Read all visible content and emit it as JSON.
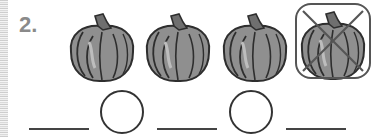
{
  "exercise": {
    "number_label": "2.",
    "pumpkins": [
      {
        "icon": "pumpkin-icon",
        "crossed_out": false
      },
      {
        "icon": "pumpkin-icon",
        "crossed_out": false
      },
      {
        "icon": "pumpkin-icon",
        "crossed_out": false
      },
      {
        "icon": "pumpkin-icon",
        "crossed_out": true
      }
    ],
    "answer_row": {
      "blanks": [
        "",
        "",
        ""
      ],
      "operator_circles": [
        "",
        ""
      ]
    }
  },
  "colors": {
    "pumpkin_fill": "#8f8f8f",
    "outline": "#333333",
    "number": "#8a8a8a"
  }
}
